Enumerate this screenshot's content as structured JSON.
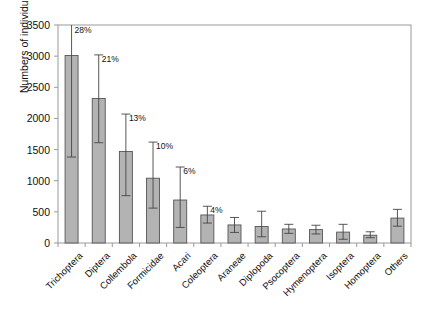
{
  "chart_data": {
    "type": "bar",
    "title": "",
    "xlabel": "",
    "ylabel": "Numbers of individuals",
    "ylim": [
      0,
      3500
    ],
    "ytick_step": 500,
    "yticks": [
      0,
      500,
      1000,
      1500,
      2000,
      2500,
      3000,
      3500
    ],
    "ytick_labels": [
      "0",
      "500",
      "1000",
      "1500",
      "2000",
      "2500",
      "3000",
      "3500"
    ],
    "grid": false,
    "legend": null,
    "error_bars": "asymmetric whiskers with caps",
    "bar_color": "#b3b3b3",
    "bar_edge_color": "#555555",
    "error_color": "#444444",
    "axis_color": "#9a9a9a",
    "categories": [
      "Trichoptera",
      "Diptera",
      "Collembola",
      "Formicidae",
      "Acari",
      "Coleoptera",
      "Araneae",
      "Diplopoda",
      "Psocoptera",
      "Hymenoptera",
      "Isoptera",
      "Homoptera",
      "Others"
    ],
    "values": [
      3010,
      2320,
      1470,
      1040,
      690,
      450,
      290,
      265,
      225,
      215,
      175,
      125,
      400
    ],
    "error_low": [
      1380,
      1610,
      760,
      560,
      250,
      320,
      170,
      100,
      155,
      145,
      60,
      85,
      270
    ],
    "error_high": [
      3560,
      3020,
      2070,
      1620,
      1220,
      590,
      410,
      510,
      300,
      285,
      300,
      180,
      540
    ],
    "data_labels": [
      "28%",
      "21%",
      "13%",
      "10%",
      "6%",
      "4%",
      "",
      "",
      "",
      "",
      "",
      "",
      ""
    ]
  }
}
